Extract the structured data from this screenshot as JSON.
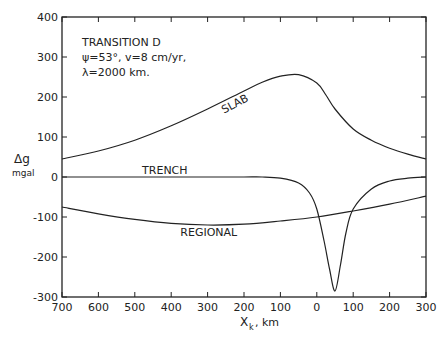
{
  "annotation": {
    "line1": "TRANSITION D",
    "line2": "ψ=53°, v=8 cm/yr,",
    "line3": "λ=2000 km."
  },
  "axes": {
    "ylabel_main": "Δg",
    "ylabel_unit": "mgal",
    "xlabel_main": "X",
    "xlabel_sub": "k",
    "xlabel_unit": ", km"
  },
  "chart_data": {
    "type": "line",
    "title": "TRANSITION D  ψ=53°, v=8 cm/yr, λ=2000 km.",
    "xlabel": "X_k, km",
    "ylabel": "Δg mgal",
    "xlim": [
      -700,
      300
    ],
    "ylim": [
      -300,
      400
    ],
    "x_tick_labels": [
      "700",
      "600",
      "500",
      "400",
      "300",
      "200",
      "100",
      "0",
      "100",
      "200",
      "300"
    ],
    "y_tick_labels": [
      "400",
      "300",
      "200",
      "100",
      "0",
      "-100",
      "-200",
      "-300"
    ],
    "grid": false,
    "series": [
      {
        "name": "SLAB",
        "x": [
          -700,
          -600,
          -500,
          -400,
          -300,
          -200,
          -150,
          -100,
          -50,
          0,
          25,
          50,
          100,
          150,
          200,
          250,
          300
        ],
        "y": [
          45,
          65,
          92,
          128,
          170,
          215,
          237,
          252,
          256,
          235,
          205,
          170,
          120,
          92,
          72,
          57,
          45
        ]
      },
      {
        "name": "TRENCH",
        "x": [
          -700,
          -500,
          -300,
          -200,
          -150,
          -100,
          -50,
          -20,
          0,
          20,
          35,
          50,
          65,
          80,
          100,
          150,
          200,
          250,
          300
        ],
        "y": [
          0,
          0,
          0,
          0,
          0,
          -3,
          -15,
          -40,
          -80,
          -160,
          -230,
          -285,
          -220,
          -140,
          -80,
          -30,
          -10,
          -3,
          0
        ]
      },
      {
        "name": "REGIONAL",
        "x": [
          -700,
          -600,
          -500,
          -400,
          -300,
          -200,
          -100,
          0,
          100,
          200,
          300
        ],
        "y": [
          -75,
          -92,
          -106,
          -116,
          -120,
          -118,
          -110,
          -100,
          -85,
          -68,
          -48
        ]
      }
    ]
  }
}
